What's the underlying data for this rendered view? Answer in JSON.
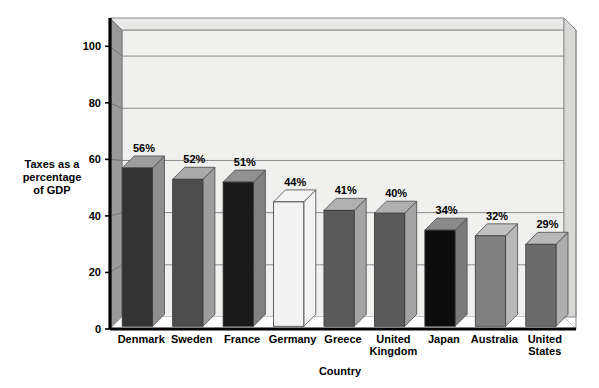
{
  "chart_data": {
    "type": "bar",
    "title": "",
    "categories": [
      "Denmark",
      "Sweden",
      "France",
      "Germany",
      "Greece",
      "United Kingdom",
      "Japan",
      "Australia",
      "United States"
    ],
    "values": [
      56,
      52,
      51,
      44,
      41,
      40,
      34,
      32,
      29
    ],
    "data_labels": [
      "56%",
      "52%",
      "51%",
      "44%",
      "41%",
      "40%",
      "34%",
      "32%",
      "29%"
    ],
    "bar_colors": [
      "#333333",
      "#4d4d4d",
      "#1a1a1a",
      "#f2f2f2",
      "#5a5a5a",
      "#5a5a5a",
      "#0d0d0d",
      "#808080",
      "#6b6b6b"
    ],
    "xlabel": "Country",
    "ylabel": "Taxes as a percentage of GDP",
    "ylabel_lines": [
      "Taxes as a",
      "percentage",
      "of GDP"
    ],
    "ylim": [
      0,
      110
    ],
    "yticks": [
      0,
      20,
      40,
      60,
      80,
      100
    ],
    "ytick_labels": [
      "0",
      "20",
      "40",
      "60",
      "80",
      "100"
    ],
    "grid": true,
    "legend": "none",
    "style": "3d-bar",
    "colors": {
      "plot_floor": "#ffffff",
      "back_wall": "#f0f0ee",
      "side_wall": "#999999",
      "top_face": "#e8e8e6",
      "gridline": "#808080",
      "axis": "#000000"
    }
  },
  "category_label_lines": [
    [
      "Denmark"
    ],
    [
      "Sweden"
    ],
    [
      "France"
    ],
    [
      "Germany"
    ],
    [
      "Greece"
    ],
    [
      "United",
      "Kingdom"
    ],
    [
      "Japan"
    ],
    [
      "Australia"
    ],
    [
      "United",
      "States"
    ]
  ]
}
